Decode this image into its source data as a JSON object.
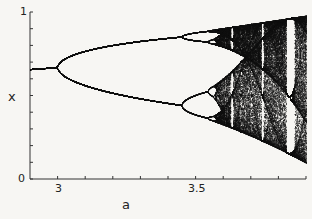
{
  "chart_data": {
    "type": "scatter",
    "title": "",
    "xlabel": "a",
    "ylabel": "x",
    "xlim": [
      2.9,
      3.9
    ],
    "ylim": [
      0,
      1
    ],
    "x_ticks": [
      3.0,
      3.1,
      3.2,
      3.3,
      3.4,
      3.5,
      3.6,
      3.7,
      3.8,
      3.9
    ],
    "x_tick_labels": [
      {
        "value": 3.0,
        "label": "3"
      },
      {
        "value": 3.5,
        "label": "3.5"
      }
    ],
    "y_ticks": [
      0,
      0.1,
      0.2,
      0.3,
      0.4,
      0.5,
      0.6,
      0.7,
      0.8,
      0.9,
      1.0
    ],
    "y_tick_labels": [
      {
        "value": 0,
        "label": "0"
      },
      {
        "value": 1,
        "label": "1"
      }
    ],
    "grid": false,
    "legend": null,
    "series": [
      {
        "name": "fixed point",
        "a_range": [
          2.9,
          3.0
        ],
        "x_values": [
          0.655,
          0.667
        ]
      },
      {
        "name": "period-2 branches",
        "a_range": [
          3.0,
          3.449
        ],
        "upper_x_at_3.449": 0.85,
        "lower_x_at_3.449": 0.44
      },
      {
        "name": "period-4 branches",
        "a_range": [
          3.449,
          3.544
        ]
      },
      {
        "name": "chaotic region",
        "a_range": [
          3.57,
          3.9
        ],
        "x_range_at_3.9": [
          0.1,
          0.975
        ]
      },
      {
        "name": "period-3 window",
        "a_range": [
          3.828,
          3.857
        ]
      }
    ],
    "annotations": [
      "Visible periodic windows near a=3.63, 3.74, 3.83"
    ]
  }
}
